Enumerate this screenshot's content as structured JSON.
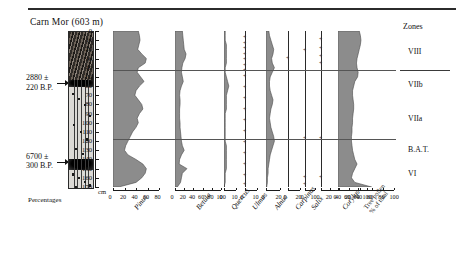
{
  "figure": {
    "title": "Carn Mor  (603 m)",
    "depth_unit": "cm",
    "percent_label": "Percentages",
    "zones_header": "Zones"
  },
  "radiocarbon_dates": [
    {
      "line1": "2880 ±",
      "line2": "220 B.P.",
      "depth_cm": 57
    },
    {
      "line1": "6700 ±",
      "line2": "300 B.P.",
      "depth_cm": 143
    }
  ],
  "depth_axis": {
    "unit": "cm",
    "min": 0,
    "max": 170,
    "step": 10,
    "ticks": [
      "0",
      "10",
      "20",
      "30",
      "40",
      "50",
      "60",
      "70",
      "80",
      "90",
      "100",
      "110",
      "120",
      "130",
      "140",
      "150",
      "160",
      "170"
    ]
  },
  "zones": [
    {
      "label": "VIII",
      "top_cm": 0,
      "bottom_cm": 43
    },
    {
      "label": "VIIb",
      "top_cm": 43,
      "bottom_cm": 72
    },
    {
      "label": "VIIa",
      "top_cm": 72,
      "bottom_cm": 118
    },
    {
      "label": "B.A.T.",
      "top_cm": 118,
      "bottom_cm": 140
    },
    {
      "label": "VI",
      "top_cm": 140,
      "bottom_cm": 170
    }
  ],
  "zone_boundaries_cm": [
    43,
    118
  ],
  "chart_data": {
    "type": "area",
    "title": "Carn Mor (603 m)",
    "subtitle": "Pollen percentage diagram",
    "xlabel": "Percentages",
    "ylabel": "Depth (cm)",
    "ylim": [
      0,
      170
    ],
    "y_inverted": true,
    "grid": false,
    "legend": "none",
    "depths_cm": [
      0,
      5,
      10,
      15,
      20,
      25,
      30,
      35,
      40,
      45,
      50,
      55,
      60,
      65,
      70,
      75,
      80,
      85,
      90,
      95,
      100,
      105,
      110,
      115,
      120,
      125,
      130,
      135,
      140,
      145,
      150,
      155,
      160,
      165,
      170
    ],
    "series": [
      {
        "name": "Pinus",
        "italic": true,
        "axis": {
          "min": 0,
          "max": 80,
          "ticks": [
            0,
            20,
            40,
            60,
            80
          ],
          "tick_labels": [
            "0",
            "20",
            "40",
            "60",
            "80"
          ]
        },
        "values": [
          44,
          46,
          47,
          45,
          43,
          50,
          58,
          56,
          44,
          42,
          48,
          54,
          46,
          40,
          38,
          44,
          50,
          52,
          46,
          42,
          44,
          40,
          34,
          30,
          26,
          22,
          20,
          26,
          40,
          52,
          58,
          56,
          50,
          40,
          10
        ]
      },
      {
        "name": "Betula",
        "italic": true,
        "axis": {
          "min": 0,
          "max": 100,
          "ticks": [
            0,
            20,
            40,
            60,
            80,
            100
          ],
          "tick_labels": [
            "0",
            "20",
            "40",
            "60",
            "80",
            "100"
          ]
        },
        "values": [
          16,
          17,
          18,
          19,
          20,
          24,
          22,
          17,
          15,
          14,
          16,
          18,
          14,
          11,
          10,
          11,
          11,
          10,
          10,
          10,
          11,
          11,
          12,
          13,
          14,
          16,
          20,
          14,
          10,
          9,
          26,
          16,
          14,
          12,
          5
        ]
      },
      {
        "name": "Quercus",
        "italic": true,
        "axis": {
          "min": 0,
          "max": 10,
          "ticks": [
            0,
            10
          ],
          "tick_labels": [
            "0",
            "10"
          ]
        },
        "values": [
          1,
          1,
          1,
          2,
          2,
          2,
          2,
          2,
          1,
          1,
          2,
          3,
          4,
          3,
          2,
          2,
          2,
          2,
          1,
          1,
          1,
          1,
          1,
          1,
          1,
          2,
          2,
          2,
          2,
          2,
          2,
          1,
          1,
          1,
          0
        ]
      },
      {
        "name": "Ulmus",
        "italic": true,
        "axis": {
          "min": 0,
          "max": 10,
          "ticks": [
            0,
            10
          ],
          "tick_labels": [
            "0",
            "10"
          ]
        },
        "values": [
          0,
          0,
          0,
          0,
          0,
          0,
          0,
          0,
          0,
          0,
          0,
          0,
          0,
          0,
          0,
          0,
          0,
          0,
          0,
          0,
          0,
          0,
          0,
          0,
          0,
          0,
          0,
          0,
          0,
          0,
          0,
          0,
          0,
          0,
          0
        ],
        "presence_marks_cm": [
          8,
          14,
          20,
          26,
          32,
          38,
          44,
          50,
          62,
          74,
          86,
          98,
          110,
          122,
          134,
          146,
          158,
          168
        ]
      },
      {
        "name": "Alnus",
        "italic": true,
        "axis": {
          "min": 0,
          "max": 20,
          "ticks": [
            0,
            20
          ],
          "tick_labels": [
            "0",
            "20"
          ]
        },
        "values": [
          4,
          5,
          7,
          9,
          11,
          10,
          8,
          9,
          12,
          9,
          6,
          5,
          5,
          6,
          8,
          10,
          9,
          7,
          6,
          5,
          6,
          7,
          9,
          11,
          12,
          10,
          8,
          6,
          5,
          4,
          3,
          3,
          2,
          2,
          1
        ]
      },
      {
        "name": "Carpinus",
        "italic": true,
        "axis": {
          "min": 0,
          "max": 20,
          "ticks": [
            0,
            20
          ],
          "tick_labels": [
            "0",
            "20"
          ]
        },
        "values": [
          0,
          0,
          0,
          0,
          0,
          0,
          0,
          0,
          0,
          0,
          0,
          0,
          0,
          0,
          0,
          0,
          0,
          0,
          0,
          0,
          0,
          0,
          0,
          0,
          0,
          0,
          0,
          0,
          0,
          0,
          0,
          0,
          0,
          0,
          0
        ],
        "presence_marks_cm": [
          30
        ]
      },
      {
        "name": "Salix",
        "italic": true,
        "axis": {
          "min": 0,
          "max": 10,
          "ticks": [
            0,
            10
          ],
          "tick_labels": [
            "0",
            "10"
          ]
        },
        "values": [
          0,
          0,
          0,
          0,
          0,
          0,
          0,
          0,
          0,
          0,
          0,
          0,
          0,
          0,
          0,
          0,
          0,
          0,
          0,
          0,
          0,
          0,
          0,
          0,
          0,
          0,
          0,
          0,
          0,
          0,
          0,
          0,
          0,
          0,
          0
        ],
        "presence_marks_cm": [
          22,
          118,
          160,
          168
        ]
      },
      {
        "name": "Corylus",
        "italic": true,
        "axis": {
          "min": 0,
          "max": 100,
          "ticks": [
            0,
            20,
            40,
            60,
            80,
            100
          ],
          "tick_labels": [
            "0",
            "20",
            "40",
            "60",
            "80",
            "100"
          ]
        },
        "values": [
          0,
          0,
          0,
          0,
          0,
          0,
          0,
          0,
          0,
          0,
          0,
          0,
          0,
          0,
          0,
          0,
          0,
          0,
          0,
          0,
          0,
          0,
          0,
          0,
          0,
          0,
          0,
          0,
          0,
          0,
          0,
          0,
          0,
          0,
          0
        ],
        "presence_marks_cm": [
          10,
          20,
          28,
          36,
          118,
          160
        ]
      },
      {
        "name": "Tree pollen % of total",
        "italic": false,
        "axis": {
          "min": 0,
          "max": 100,
          "ticks": [
            0,
            20,
            40,
            60,
            80,
            100
          ],
          "tick_labels": [
            "0",
            "20",
            "40",
            "60",
            "80",
            "100"
          ]
        },
        "values": [
          38,
          40,
          41,
          40,
          38,
          36,
          34,
          33,
          34,
          36,
          35,
          30,
          28,
          26,
          26,
          27,
          28,
          28,
          27,
          26,
          26,
          25,
          25,
          24,
          24,
          25,
          26,
          28,
          30,
          34,
          30,
          26,
          24,
          30,
          60
        ]
      }
    ],
    "second_panel": {
      "name": "Tree pollen % of total",
      "values": [
        62,
        66,
        70,
        68,
        62,
        58,
        54,
        56,
        60,
        58,
        52,
        46,
        44,
        48,
        56,
        62,
        58,
        52,
        46,
        44,
        46,
        48,
        52,
        56,
        58,
        54,
        50,
        48,
        52,
        64,
        72,
        70,
        62,
        54,
        18
      ]
    }
  },
  "lithology": {
    "label": "stratigraphic-column",
    "bands": [
      {
        "from_cm": 0,
        "to_cm": 52,
        "type": "peat-dark"
      },
      {
        "from_cm": 52,
        "to_cm": 60,
        "type": "dark-band"
      },
      {
        "from_cm": 60,
        "to_cm": 138,
        "type": "light-silt"
      },
      {
        "from_cm": 138,
        "to_cm": 150,
        "type": "dark-band"
      },
      {
        "from_cm": 150,
        "to_cm": 170,
        "type": "light-silt"
      }
    ]
  }
}
